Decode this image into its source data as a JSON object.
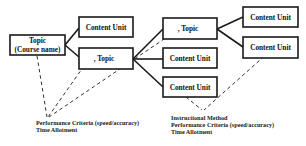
{
  "diagram": {
    "nodes": [
      {
        "id": "root",
        "line1": "Topic",
        "line2": "(Course name)"
      },
      {
        "id": "cu1",
        "label": "Content Unit"
      },
      {
        "id": "topicA",
        "label": ", Topic"
      },
      {
        "id": "topicB",
        "label": ", Topic"
      },
      {
        "id": "cu2",
        "label": "Content Unit"
      },
      {
        "id": "cu3",
        "label": "Content Unit"
      },
      {
        "id": "cu4",
        "label": "Content Unit"
      },
      {
        "id": "cu5",
        "label": "Content Unit"
      }
    ],
    "annotations": {
      "left": {
        "line1": "Performance Criteria (speed/accuracy)",
        "line2": "Time Allotment"
      },
      "right": {
        "line1": "Instructional Method",
        "line2": "Performance Criteria (speed/accuracy)",
        "line3": "Time Allotment"
      }
    }
  }
}
